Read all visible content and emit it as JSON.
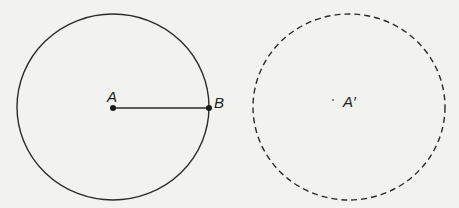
{
  "diagram": {
    "colors": {
      "background": "#f2f2f0",
      "stroke": "#2a2a2a"
    },
    "original_circle": {
      "cx": 113,
      "cy": 107,
      "rx": 96,
      "ry": 93,
      "style": "solid",
      "center_label": "A",
      "point_label": "B"
    },
    "radius_segment": {
      "from": "A",
      "to": "B",
      "x1": 113,
      "y1": 108,
      "x2": 209,
      "y2": 108
    },
    "image_circle": {
      "cx": 349,
      "cy": 107,
      "rx": 96,
      "ry": 93,
      "style": "dashed",
      "center_label": "A′"
    }
  }
}
